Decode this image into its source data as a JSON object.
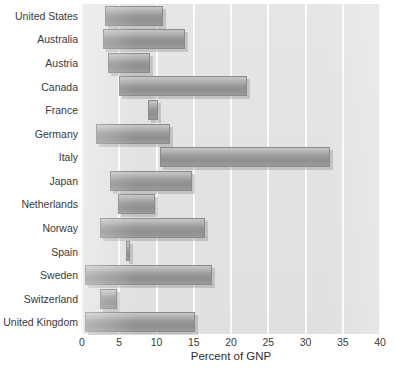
{
  "chart_data": {
    "type": "bar",
    "subtype": "floating-range-bar",
    "title": "",
    "subtitle": "",
    "xlabel": "Percent of GNP",
    "ylabel": "",
    "xlim": [
      0,
      40
    ],
    "ylim": null,
    "xticks": [
      0,
      5,
      10,
      15,
      20,
      25,
      30,
      35,
      40
    ],
    "xtick_labels": [
      "0",
      "5",
      "10",
      "15",
      "20",
      "25",
      "30",
      "35",
      "40"
    ],
    "grid": "vertical-white-gridlines",
    "legend": null,
    "orientation": "horizontal",
    "categories": [
      "United States",
      "Australia",
      "Austria",
      "Canada",
      "France",
      "Germany",
      "Italy",
      "Japan",
      "Netherlands",
      "Norway",
      "Spain",
      "Sweden",
      "Switzerland",
      "United Kingdom"
    ],
    "series": [
      {
        "name": "Range of percent of GNP",
        "type": "range",
        "low": [
          3.1,
          2.8,
          3.5,
          5.0,
          8.8,
          1.9,
          10.5,
          3.8,
          4.8,
          2.4,
          5.9,
          0.4,
          2.4,
          0.4
        ],
        "high": [
          10.9,
          13.8,
          9.1,
          22.1,
          10.2,
          11.8,
          33.3,
          14.8,
          9.8,
          16.5,
          6.4,
          17.4,
          4.7,
          15.2
        ]
      }
    ],
    "bars": [
      {
        "category": "United States",
        "low": 3.1,
        "high": 10.9,
        "span": 7.8
      },
      {
        "category": "Australia",
        "low": 2.8,
        "high": 13.8,
        "span": 11.0
      },
      {
        "category": "Austria",
        "low": 3.5,
        "high": 9.1,
        "span": 5.6
      },
      {
        "category": "Canada",
        "low": 5.0,
        "high": 22.1,
        "span": 17.1
      },
      {
        "category": "France",
        "low": 8.8,
        "high": 10.2,
        "span": 1.4
      },
      {
        "category": "Germany",
        "low": 1.9,
        "high": 11.8,
        "span": 9.9
      },
      {
        "category": "Italy",
        "low": 10.5,
        "high": 33.3,
        "span": 22.8
      },
      {
        "category": "Japan",
        "low": 3.8,
        "high": 14.8,
        "span": 11.0
      },
      {
        "category": "Netherlands",
        "low": 4.8,
        "high": 9.8,
        "span": 5.0
      },
      {
        "category": "Norway",
        "low": 2.4,
        "high": 16.5,
        "span": 14.1
      },
      {
        "category": "Spain",
        "low": 5.9,
        "high": 6.4,
        "span": 0.5
      },
      {
        "category": "Sweden",
        "low": 0.4,
        "high": 17.4,
        "span": 17.0
      },
      {
        "category": "Switzerland",
        "low": 2.4,
        "high": 4.7,
        "span": 2.3
      },
      {
        "category": "United Kingdom",
        "low": 0.4,
        "high": 15.2,
        "span": 14.8
      }
    ],
    "colors": {
      "bar_fill": "#9d9d9d",
      "bar_border": "#8a8a8a",
      "bar_shadow": "#b4b4b4",
      "plot_background": "#e4e4e4",
      "gridline": "#fbfbfb",
      "text": "#3a3a3a",
      "page_background": "#ffffff"
    }
  }
}
